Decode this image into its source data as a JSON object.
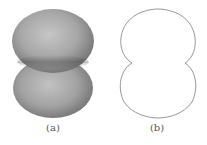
{
  "figure": {
    "panels": [
      {
        "id": "a",
        "label": "(a)",
        "description": "3D shaded surface of two fused spheres"
      },
      {
        "id": "b",
        "label": "(b)",
        "description": "2D outline cross-section with cusps at waist"
      }
    ]
  },
  "colors": {
    "surface_light": "#c4c4c4",
    "surface_mid": "#a2a2a2",
    "surface_dark": "#6e6e6e",
    "waist_band": "#8a8a8a",
    "outline_stroke": "#8c8c8c",
    "caption_text": "#555555",
    "background": "#ffffff"
  }
}
